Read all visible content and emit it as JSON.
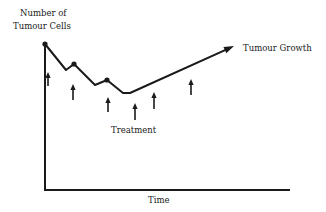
{
  "diagram": {
    "type": "line-schematic",
    "y_axis_label_line1": "Number of",
    "y_axis_label_line2": "Tumour Cells",
    "x_axis_label": "Time",
    "curve_label": "Tumour Growth",
    "arrows_label": "Treatment",
    "line_color": "#1a1a1a",
    "curve_points": [
      [
        45,
        44
      ],
      [
        66,
        70
      ],
      [
        74,
        64
      ],
      [
        95,
        85
      ],
      [
        107,
        80
      ],
      [
        123,
        93
      ],
      [
        130,
        93
      ],
      [
        234,
        46
      ]
    ],
    "dose_points": [
      [
        45,
        44
      ],
      [
        74,
        64
      ],
      [
        107,
        80
      ]
    ],
    "treatment_arrows": [
      {
        "x": 48,
        "y_tip": 72,
        "y_base": 86
      },
      {
        "x": 73,
        "y_tip": 84,
        "y_base": 100
      },
      {
        "x": 108,
        "y_tip": 97,
        "y_base": 112
      },
      {
        "x": 135,
        "y_tip": 103,
        "y_base": 120
      },
      {
        "x": 154,
        "y_tip": 92,
        "y_base": 109
      },
      {
        "x": 191,
        "y_tip": 79,
        "y_base": 95
      }
    ]
  }
}
